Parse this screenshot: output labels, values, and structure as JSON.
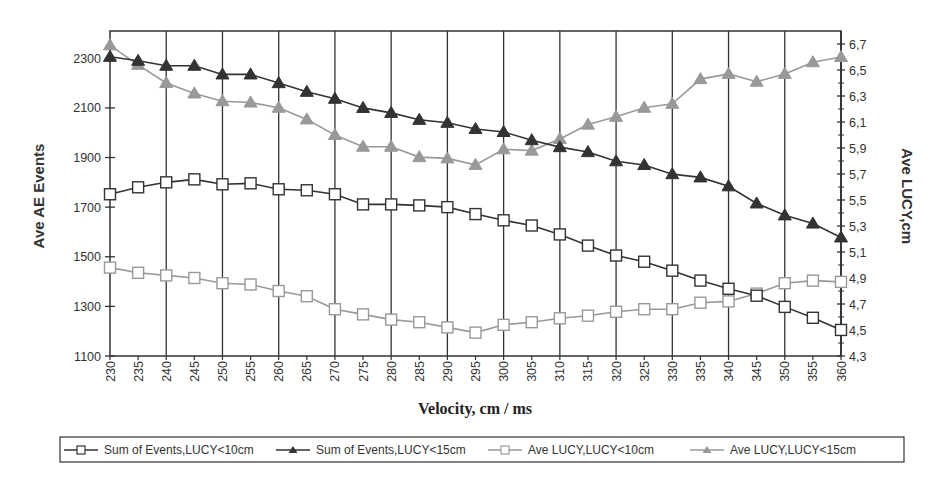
{
  "chart_data": {
    "type": "line",
    "title": "",
    "xlabel": "Velocity, cm / ms",
    "ylabel": "Ave AE Events",
    "y2label": "Ave LUCY,cm",
    "x": [
      230,
      235,
      240,
      245,
      250,
      255,
      260,
      265,
      270,
      275,
      280,
      285,
      290,
      295,
      300,
      305,
      310,
      315,
      320,
      325,
      330,
      335,
      340,
      345,
      350,
      355,
      360
    ],
    "x_ticks": [
      "230",
      "235",
      "240",
      "245",
      "250",
      "255",
      "260",
      "265",
      "270",
      "275",
      "280",
      "285",
      "290",
      "295",
      "300",
      "305",
      "310",
      "315",
      "320",
      "325",
      "330",
      "335",
      "340",
      "345",
      "350",
      "355",
      "360"
    ],
    "xlim": [
      230,
      360
    ],
    "ylim": [
      1100,
      2410
    ],
    "y_ticks": [
      "1100",
      "1300",
      "1500",
      "1700",
      "1900",
      "2100",
      "2300"
    ],
    "y_tick_values": [
      1100,
      1300,
      1500,
      1700,
      1900,
      2100,
      2300
    ],
    "y2lim": [
      4.3,
      6.8
    ],
    "y2_ticks": [
      "4,3",
      "4,5",
      "4,7",
      "4,9",
      "5,1",
      "5,3",
      "5,5",
      "5,7",
      "5,9",
      "6,1",
      "6,3",
      "6,5",
      "6,7"
    ],
    "y2_tick_values": [
      4.3,
      4.5,
      4.7,
      4.9,
      5.1,
      5.3,
      5.5,
      5.7,
      5.9,
      6.1,
      6.3,
      6.5,
      6.7
    ],
    "grid": "vertical lines every 10 units",
    "legend_position": "bottom",
    "series": [
      {
        "name": "Sum of Events,LUCY<10cm",
        "axis": "left",
        "marker": "square-open",
        "color": "#333333",
        "values": [
          1752,
          1780,
          1800,
          1812,
          1792,
          1796,
          1772,
          1768,
          1752,
          1711,
          1711,
          1707,
          1700,
          1672,
          1647,
          1626,
          1590,
          1545,
          1505,
          1480,
          1444,
          1404,
          1371,
          1343,
          1298,
          1254,
          1205
        ]
      },
      {
        "name": "Sum of Events,LUCY<15cm",
        "axis": "left",
        "marker": "triangle-filled",
        "color": "#333333",
        "values": [
          2306,
          2290,
          2270,
          2270,
          2235,
          2235,
          2200,
          2165,
          2137,
          2100,
          2080,
          2052,
          2040,
          2015,
          2003,
          1970,
          1942,
          1922,
          1885,
          1870,
          1833,
          1820,
          1784,
          1715,
          1667,
          1634,
          1578
        ]
      },
      {
        "name": "Ave LUCY,LUCY<10cm",
        "axis": "right",
        "marker": "square-open",
        "color": "#999999",
        "values": [
          4.98,
          4.94,
          4.92,
          4.9,
          4.86,
          4.85,
          4.8,
          4.76,
          4.66,
          4.62,
          4.58,
          4.56,
          4.52,
          4.48,
          4.54,
          4.56,
          4.59,
          4.61,
          4.64,
          4.66,
          4.66,
          4.71,
          4.72,
          4.78,
          4.86,
          4.88,
          4.87
        ]
      },
      {
        "name": "Ave LUCY,LUCY<15cm",
        "axis": "right",
        "marker": "triangle-filled",
        "color": "#999999",
        "values": [
          6.69,
          6.54,
          6.4,
          6.32,
          6.26,
          6.25,
          6.21,
          6.12,
          6.0,
          5.91,
          5.91,
          5.83,
          5.82,
          5.77,
          5.89,
          5.88,
          5.97,
          6.08,
          6.14,
          6.21,
          6.24,
          6.43,
          6.47,
          6.41,
          6.47,
          6.56,
          6.6
        ]
      }
    ]
  }
}
